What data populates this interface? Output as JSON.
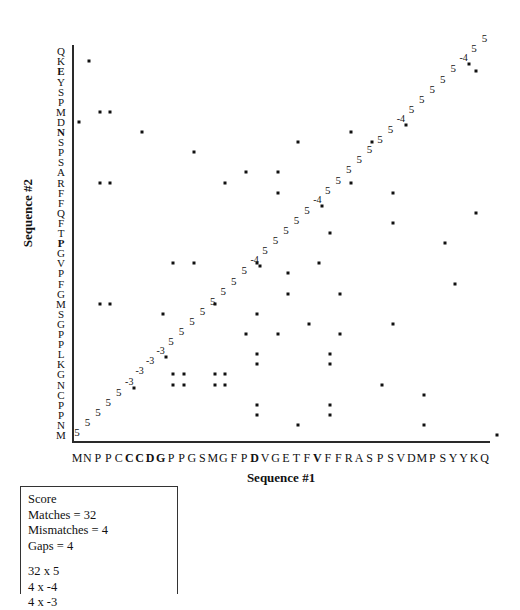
{
  "chart_data": {
    "type": "scatter",
    "title": "",
    "xlabel": "Sequence #1",
    "ylabel": "Sequence #2",
    "grid": false,
    "legend": null,
    "x_tick_labels": [
      "M",
      "N",
      "P",
      "P",
      "C",
      "C",
      "C",
      "D",
      "G",
      "P",
      "P",
      "G",
      "S",
      "M",
      "G",
      "F",
      "P",
      "D",
      "V",
      "G",
      "E",
      "T",
      "F",
      "V",
      "F",
      "F",
      "R",
      "A",
      "S",
      "P",
      "S",
      "V",
      "D",
      "M",
      "P",
      "S",
      "Y",
      "Y",
      "K",
      "Q"
    ],
    "x_bold_indices": [
      5,
      6,
      7,
      8,
      17,
      23
    ],
    "y_tick_labels_top_to_bottom": [
      "Q",
      "K",
      "E",
      "Y",
      "S",
      "P",
      "M",
      "D",
      "N",
      "S",
      "P",
      "S",
      "A",
      "R",
      "F",
      "F",
      "Q",
      "F",
      "T",
      "P",
      "G",
      "V",
      "P",
      "F",
      "G",
      "M",
      "S",
      "G",
      "P",
      "P",
      "L",
      "K",
      "G",
      "N",
      "C",
      "P",
      "P",
      "N",
      "M"
    ],
    "y_bold_indices": [
      2,
      8,
      19
    ],
    "xlim": [
      0,
      40
    ],
    "ylim": [
      0,
      39
    ],
    "dots": [
      {
        "x": 1,
        "y": 37
      },
      {
        "x": 2,
        "y": 32
      },
      {
        "x": 3,
        "y": 32
      },
      {
        "x": 0,
        "y": 31
      },
      {
        "x": 6,
        "y": 30
      },
      {
        "x": 11,
        "y": 28
      },
      {
        "x": 16,
        "y": 26
      },
      {
        "x": 21,
        "y": 29
      },
      {
        "x": 26,
        "y": 30
      },
      {
        "x": 28,
        "y": 29
      },
      {
        "x": 2,
        "y": 25
      },
      {
        "x": 3,
        "y": 25
      },
      {
        "x": 14,
        "y": 25
      },
      {
        "x": 19,
        "y": 26
      },
      {
        "x": 19,
        "y": 24
      },
      {
        "x": 26,
        "y": 25
      },
      {
        "x": 24,
        "y": 20
      },
      {
        "x": 9,
        "y": 17
      },
      {
        "x": 11,
        "y": 17
      },
      {
        "x": 17,
        "y": 17
      },
      {
        "x": 23,
        "y": 17
      },
      {
        "x": 20,
        "y": 16
      },
      {
        "x": 20,
        "y": 14
      },
      {
        "x": 25,
        "y": 14
      },
      {
        "x": 2,
        "y": 13
      },
      {
        "x": 3,
        "y": 13
      },
      {
        "x": 13,
        "y": 13
      },
      {
        "x": 8,
        "y": 12
      },
      {
        "x": 17,
        "y": 12
      },
      {
        "x": 22,
        "y": 11
      },
      {
        "x": 30,
        "y": 11
      },
      {
        "x": 16,
        "y": 10
      },
      {
        "x": 19,
        "y": 10
      },
      {
        "x": 25,
        "y": 10
      },
      {
        "x": 17,
        "y": 8
      },
      {
        "x": 24,
        "y": 8
      },
      {
        "x": 17,
        "y": 7
      },
      {
        "x": 24,
        "y": 7
      },
      {
        "x": 9,
        "y": 6
      },
      {
        "x": 10,
        "y": 6
      },
      {
        "x": 13,
        "y": 6
      },
      {
        "x": 14,
        "y": 6
      },
      {
        "x": 9,
        "y": 5
      },
      {
        "x": 10,
        "y": 5
      },
      {
        "x": 13,
        "y": 5
      },
      {
        "x": 14,
        "y": 5
      },
      {
        "x": 29,
        "y": 5
      },
      {
        "x": 33,
        "y": 4
      },
      {
        "x": 17,
        "y": 3
      },
      {
        "x": 24,
        "y": 3
      },
      {
        "x": 17,
        "y": 2
      },
      {
        "x": 24,
        "y": 2
      },
      {
        "x": 21,
        "y": 1
      },
      {
        "x": 33,
        "y": 1
      },
      {
        "x": 38,
        "y": 36
      },
      {
        "x": 30,
        "y": 24
      },
      {
        "x": 30,
        "y": 21
      },
      {
        "x": 35,
        "y": 19
      },
      {
        "x": 38,
        "y": 22
      },
      {
        "x": 36,
        "y": 15
      },
      {
        "x": 40,
        "y": 0
      }
    ],
    "path_scores": [
      {
        "x": 0,
        "y": 0,
        "v": "5"
      },
      {
        "x": 1,
        "y": 1,
        "v": "5"
      },
      {
        "x": 2,
        "y": 2,
        "v": "5"
      },
      {
        "x": 3,
        "y": 3,
        "v": "5"
      },
      {
        "x": 4,
        "y": 4,
        "v": "5"
      },
      {
        "x": 5,
        "y": 5,
        "v": "-3"
      },
      {
        "x": 6,
        "y": 6,
        "v": "-3"
      },
      {
        "x": 7,
        "y": 7,
        "v": "-3"
      },
      {
        "x": 8,
        "y": 8,
        "v": "-3"
      },
      {
        "x": 9,
        "y": 9,
        "v": "5"
      },
      {
        "x": 10,
        "y": 10,
        "v": "5"
      },
      {
        "x": 11,
        "y": 11,
        "v": "5"
      },
      {
        "x": 12,
        "y": 12,
        "v": "5"
      },
      {
        "x": 13,
        "y": 13,
        "v": "5"
      },
      {
        "x": 14,
        "y": 14,
        "v": "5"
      },
      {
        "x": 15,
        "y": 15,
        "v": "5"
      },
      {
        "x": 16,
        "y": 16,
        "v": "5"
      },
      {
        "x": 17,
        "y": 17,
        "v": "-4"
      },
      {
        "x": 18,
        "y": 18,
        "v": "5"
      },
      {
        "x": 19,
        "y": 19,
        "v": "5"
      },
      {
        "x": 20,
        "y": 20,
        "v": "5"
      },
      {
        "x": 21,
        "y": 21,
        "v": "5"
      },
      {
        "x": 22,
        "y": 22,
        "v": "5"
      },
      {
        "x": 23,
        "y": 23,
        "v": "-4"
      },
      {
        "x": 24,
        "y": 24,
        "v": "5"
      },
      {
        "x": 25,
        "y": 25,
        "v": "5"
      },
      {
        "x": 26,
        "y": 26,
        "v": "5"
      },
      {
        "x": 27,
        "y": 27,
        "v": "5"
      },
      {
        "x": 28,
        "y": 28,
        "v": "5"
      },
      {
        "x": 29,
        "y": 29,
        "v": "5"
      },
      {
        "x": 30,
        "y": 30,
        "v": "5"
      },
      {
        "x": 31,
        "y": 31,
        "v": "-4"
      },
      {
        "x": 32,
        "y": 32,
        "v": "5"
      },
      {
        "x": 33,
        "y": 33,
        "v": "5"
      },
      {
        "x": 34,
        "y": 34,
        "v": "5"
      },
      {
        "x": 35,
        "y": 35,
        "v": "5"
      },
      {
        "x": 36,
        "y": 36,
        "v": "5"
      },
      {
        "x": 37,
        "y": 37,
        "v": "-4"
      },
      {
        "x": 38,
        "y": 38,
        "v": "5"
      },
      {
        "x": 39,
        "y": 39,
        "v": "5"
      }
    ],
    "path_dots": [
      {
        "x": 5,
        "y": 5
      },
      {
        "x": 8,
        "y": 8
      },
      {
        "x": 17,
        "y": 17
      },
      {
        "x": 23,
        "y": 23
      },
      {
        "x": 31,
        "y": 31
      },
      {
        "x": 37,
        "y": 37
      }
    ]
  },
  "axes": {
    "x_title": "Sequence #1",
    "y_title": "Sequence #2"
  },
  "score_box": {
    "heading": "Score",
    "matches_line": "Matches = 32",
    "mismatches_line": "Mismatches = 4",
    "gaps_line": "Gaps = 4",
    "calc_matches": "32 x 5",
    "calc_mismatches": "4 x -4",
    "calc_gaps": "4 x -3"
  }
}
